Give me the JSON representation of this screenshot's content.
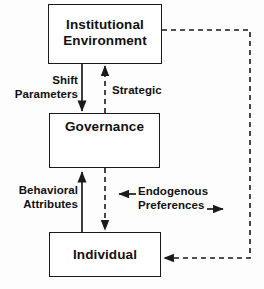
{
  "diagram": {
    "colors": {
      "stroke": "#1a1a1a",
      "background": "#fdfdfd",
      "text": "#111111"
    },
    "nodes": [
      {
        "id": "institutional",
        "label": "Institutional\nEnvironment"
      },
      {
        "id": "governance",
        "label": "Governance"
      },
      {
        "id": "individual",
        "label": "Individual"
      }
    ],
    "edge_labels": {
      "shift_parameters": "Shift\nParameters",
      "strategic": "Strategic",
      "behavioral_attributes": "Behavioral\nAttributes",
      "endogenous_preferences": "Endogenous\nPreferences"
    },
    "icons": {
      "self_loop": "circular-arrow-icon",
      "arrow_left": "arrow-left-icon",
      "arrow_right": "arrow-right-icon"
    },
    "edges": [
      {
        "from": "institutional",
        "to": "governance",
        "style": "solid",
        "label": "Shift\nParameters"
      },
      {
        "from": "governance",
        "to": "institutional",
        "style": "dashed",
        "label": "Strategic"
      },
      {
        "from": "individual",
        "to": "governance",
        "style": "solid",
        "label": "Behavioral\nAttributes"
      },
      {
        "from": "governance",
        "to": "individual",
        "style": "dashed",
        "label": ""
      },
      {
        "from": "governance",
        "to": "governance",
        "style": "solid",
        "label": ""
      },
      {
        "from": "institutional",
        "to": "individual",
        "style": "dashed",
        "label": "Endogenous\nPreferences"
      }
    ]
  }
}
